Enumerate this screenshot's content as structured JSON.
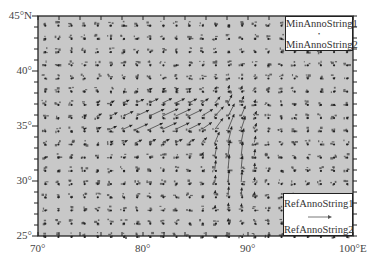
{
  "map": {
    "background_color": "#c8c8c8",
    "frame_color": "#222222",
    "vector_color": "#444444",
    "extent": {
      "lon_min": 70,
      "lon_max": 100,
      "lat_min": 25,
      "lat_max": 45
    },
    "x_axis": {
      "labels": [
        {
          "text": "70°",
          "lon": 70
        },
        {
          "text": "80°",
          "lon": 80
        },
        {
          "text": "90°",
          "lon": 90
        },
        {
          "text": "100°E",
          "lon": 100
        }
      ],
      "minor_tick_step": 2
    },
    "y_axis": {
      "labels": [
        {
          "text": "45°N",
          "lat": 45
        },
        {
          "text": "40°",
          "lat": 40
        },
        {
          "text": "35°",
          "lat": 35
        },
        {
          "text": "30°",
          "lat": 30
        },
        {
          "text": "25°",
          "lat": 25
        }
      ],
      "minor_tick_step": 1
    },
    "vector_grid": {
      "lon_step": 1.25,
      "lat_step": 1.2
    },
    "flow_features": [
      {
        "name": "westerly-jet",
        "center_lon": 82,
        "center_lat": 35.5,
        "direction_deg": 25,
        "strength": 1.0
      },
      {
        "name": "southerly-band",
        "center_lon": 88.5,
        "center_lat": 32.5,
        "direction_deg": 85,
        "strength": 0.9
      }
    ]
  },
  "legend_min": {
    "line1": "MinAnnoString1",
    "line2": "MinAnnoString2"
  },
  "legend_ref": {
    "line1": "RefAnnoString1",
    "line2": "RefAnnoString2"
  }
}
